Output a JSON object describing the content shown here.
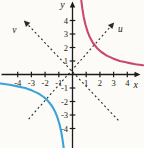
{
  "figure": {
    "background": "#fcfbf7"
  },
  "chart_data": {
    "type": "line",
    "equation": "xy = 3.5",
    "xlabel": "x",
    "ylabel": "y",
    "xlim": [
      -5.3,
      5.2
    ],
    "ylim": [
      -5.5,
      5.6
    ],
    "grid": false,
    "x_ticks": [
      -4,
      -3,
      -2,
      -1,
      1,
      2,
      3,
      4
    ],
    "y_ticks": [
      -4,
      -3,
      -2,
      -1,
      1,
      2,
      3,
      4
    ],
    "layout": {
      "origin": [
        72.5,
        74.5
      ],
      "unit": [
        13.7,
        13.5
      ],
      "x_axis_px": [
        1.5,
        140.5
      ],
      "y_axis_px": [
        1.5,
        148
      ],
      "x_label_pos": [
        4.62,
        -0.78
      ],
      "y_label_pos": [
        -0.74,
        5.15
      ],
      "tick_half_len": 2.8
    },
    "style": {
      "axis_color": "#1b1b1b",
      "dash_color": "#2b2b2b",
      "dash_array": "2 2.6"
    },
    "series": [
      {
        "name": "branch-quadrant-1",
        "color": "#c9486c",
        "x": [
          0.64,
          0.72,
          0.82,
          0.95,
          1.1,
          1.28,
          1.5,
          1.78,
          2.1,
          2.5,
          2.95,
          3.45,
          4.0,
          4.6,
          5.15
        ],
        "y": [
          5.47,
          4.86,
          4.27,
          3.68,
          3.18,
          2.73,
          2.33,
          1.97,
          1.67,
          1.4,
          1.19,
          1.01,
          0.88,
          0.76,
          0.68
        ]
      },
      {
        "name": "branch-quadrant-3",
        "color": "#3ba3d8",
        "x": [
          -5.25,
          -4.6,
          -4.0,
          -3.45,
          -2.95,
          -2.5,
          -2.1,
          -1.78,
          -1.5,
          -1.28,
          -1.1,
          -0.95,
          -0.82,
          -0.72,
          -0.645
        ],
        "y": [
          -0.67,
          -0.76,
          -0.88,
          -1.01,
          -1.19,
          -1.4,
          -1.67,
          -1.97,
          -2.33,
          -2.73,
          -3.18,
          -3.68,
          -4.27,
          -4.86,
          -5.43
        ]
      }
    ],
    "rotated_axes": [
      {
        "name": "u-axis",
        "label": "u",
        "from": [
          -3.2,
          -3.3
        ],
        "to": [
          2.95,
          3.75
        ],
        "label_pos": [
          3.5,
          3.35
        ]
      },
      {
        "name": "v-axis",
        "label": "v",
        "from": [
          3.35,
          -3.4
        ],
        "to": [
          -3.45,
          3.9
        ],
        "label_pos": [
          -4.25,
          3.3
        ]
      }
    ]
  }
}
